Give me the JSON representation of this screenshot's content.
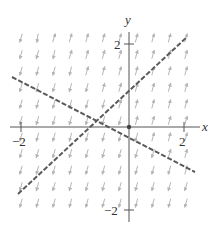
{
  "figure": {
    "type": "phase portrait / direction field",
    "axes": {
      "x_label": "x",
      "y_label": "y",
      "x_ticks": [
        {
          "value": -2,
          "label": "−2"
        },
        {
          "value": 2,
          "label": "2"
        }
      ],
      "y_ticks": [
        {
          "value": 2,
          "label": "2"
        },
        {
          "value": -2,
          "label": "−2"
        }
      ]
    },
    "separatrices": [
      {
        "name": "positive-slope-line",
        "from": [
          18,
          194
        ],
        "to": [
          187,
          37
        ],
        "style": "dashed"
      },
      {
        "name": "negative-slope-line",
        "from": [
          12,
          77
        ],
        "to": [
          195,
          172
        ],
        "style": "dashed"
      }
    ],
    "colors": {
      "axis": "#555555",
      "dashed_line": "#5a5a5a",
      "arrow": "#b5b5b5",
      "text": "#333333"
    }
  }
}
